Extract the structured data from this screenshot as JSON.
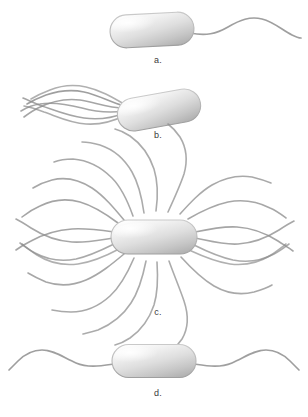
{
  "figure": {
    "background_color": "#ffffff",
    "width": 308,
    "height": 417
  },
  "colors": {
    "background": "#ffffff",
    "cell_highlight": "#fcfcfc",
    "cell_body_light": "#e8e8e8",
    "cell_body_mid": "#d2d2d2",
    "cell_edge": "#a8a8a8",
    "cell_outline": "#9a9a9a",
    "flagellum_stroke": "#8e8e8e",
    "flagellum_stroke_light": "#b4b4b4",
    "label_text": "#3a3a3a"
  },
  "panels": [
    {
      "id": "a",
      "label": "a.",
      "arrangement": "monotrichous",
      "flagella_count": 1,
      "cell": {
        "cx": 152,
        "cy": 30,
        "length": 84,
        "height": 33,
        "rotation": -3
      },
      "description": "Single polar flagellum extending from the right pole"
    },
    {
      "id": "b",
      "label": "b.",
      "arrangement": "lophotrichous",
      "flagella_count": 6,
      "cell": {
        "cx": 159,
        "cy": 110,
        "length": 84,
        "height": 33,
        "rotation": -10
      },
      "description": "Tuft of flagella at the left pole"
    },
    {
      "id": "c",
      "label": "c.",
      "arrangement": "peritrichous",
      "flagella_count": 22,
      "cell": {
        "cx": 154,
        "cy": 237,
        "length": 86,
        "height": 34,
        "rotation": 0
      },
      "description": "Flagella distributed over the entire cell surface"
    },
    {
      "id": "d",
      "label": "d.",
      "arrangement": "amphitrichous",
      "flagella_count": 2,
      "cell": {
        "cx": 154,
        "cy": 361,
        "length": 84,
        "height": 33,
        "rotation": 0
      },
      "description": "One flagellum at each pole"
    }
  ]
}
